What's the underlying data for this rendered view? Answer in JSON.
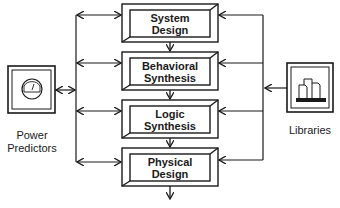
{
  "diagram": {
    "stages": [
      {
        "line1": "System",
        "line2": "Design"
      },
      {
        "line1": "Behavioral",
        "line2": "Synthesis"
      },
      {
        "line1": "Logic",
        "line2": "Synthesis"
      },
      {
        "line1": "Physical",
        "line2": "Design"
      }
    ],
    "left_source": {
      "line1": "Power",
      "line2": "Predictors",
      "icon": "gauge-icon"
    },
    "right_source": {
      "label": "Libraries",
      "icon": "library-blocks-icon"
    },
    "colors": {
      "stroke": "#1a1a1a",
      "background": "#ffffff"
    }
  }
}
